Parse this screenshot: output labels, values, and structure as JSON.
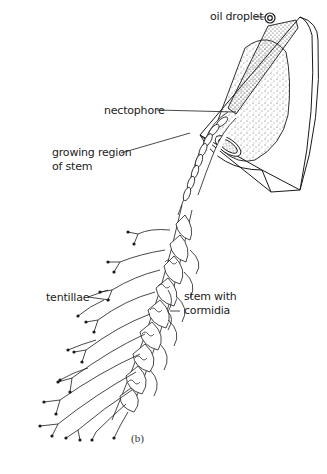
{
  "figure": {
    "caption": "(b)",
    "labels": {
      "oil_droplet": "oil droplet",
      "nectophore": "nectophore",
      "growing_region_line1": "growing region",
      "growing_region_line2": "of stem",
      "tentillae": "tentillae",
      "stem_cormidia_line1": "stem with",
      "stem_cormidia_line2": "cormidia"
    },
    "colors": {
      "ink": "#1a1a1a",
      "background": "#ffffff",
      "stipple": "#555555"
    }
  }
}
